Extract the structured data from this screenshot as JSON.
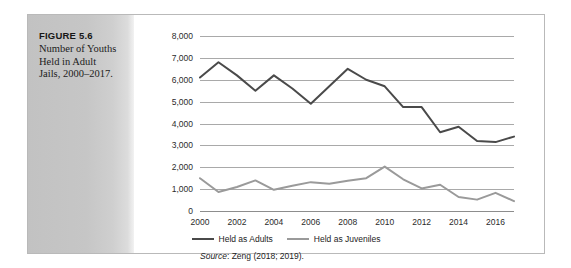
{
  "figure": {
    "number_label": "FIGURE 5.6",
    "caption_line1": "Number of Youths",
    "caption_line2": "Held in Adult",
    "caption_line3": "Jails, 2000–2017."
  },
  "source": {
    "word": "Source",
    "separator": ": ",
    "citation": "Zeng (2018; 2019)."
  },
  "colors": {
    "adults_line": "#4a4a4a",
    "juveniles_line": "#9a9a9a",
    "gridline": "#a9a9a9",
    "caption_panel": "#c6c6c6",
    "frame_border": "#b9b9b9",
    "text": "#232323"
  },
  "chart_data": {
    "type": "line",
    "title": "Number of Youths Held in Adult Jails, 2000–2017",
    "xlabel": "",
    "ylabel": "",
    "x": [
      2000,
      2001,
      2002,
      2003,
      2004,
      2005,
      2006,
      2007,
      2008,
      2009,
      2010,
      2011,
      2012,
      2013,
      2014,
      2015,
      2016,
      2017
    ],
    "xtick_labels": [
      "2000",
      "2002",
      "2004",
      "2006",
      "2008",
      "2010",
      "2012",
      "2014",
      "2016"
    ],
    "xticks": [
      2000,
      2002,
      2004,
      2006,
      2008,
      2010,
      2012,
      2014,
      2016
    ],
    "xlim": [
      2000,
      2017
    ],
    "ytick_labels": [
      "0",
      "1,000",
      "2,000",
      "3,000",
      "4,000",
      "5,000",
      "6,000",
      "7,000",
      "8,000"
    ],
    "yticks": [
      0,
      1000,
      2000,
      3000,
      4000,
      5000,
      6000,
      7000,
      8000
    ],
    "ylim": [
      0,
      8000
    ],
    "grid": true,
    "legend_position": "bottom",
    "series": [
      {
        "name": "Held as Adults",
        "color": "#4a4a4a",
        "values": [
          6100,
          6800,
          6200,
          5500,
          6200,
          5600,
          4900,
          5700,
          6500,
          6000,
          5700,
          4750,
          4750,
          3600,
          3850,
          3200,
          3150,
          3400
        ]
      },
      {
        "name": "Held as Juveniles",
        "color": "#9a9a9a",
        "values": [
          1500,
          870,
          1100,
          1400,
          970,
          1150,
          1320,
          1250,
          1380,
          1500,
          2030,
          1450,
          1030,
          1200,
          640,
          520,
          830,
          450
        ]
      }
    ]
  }
}
